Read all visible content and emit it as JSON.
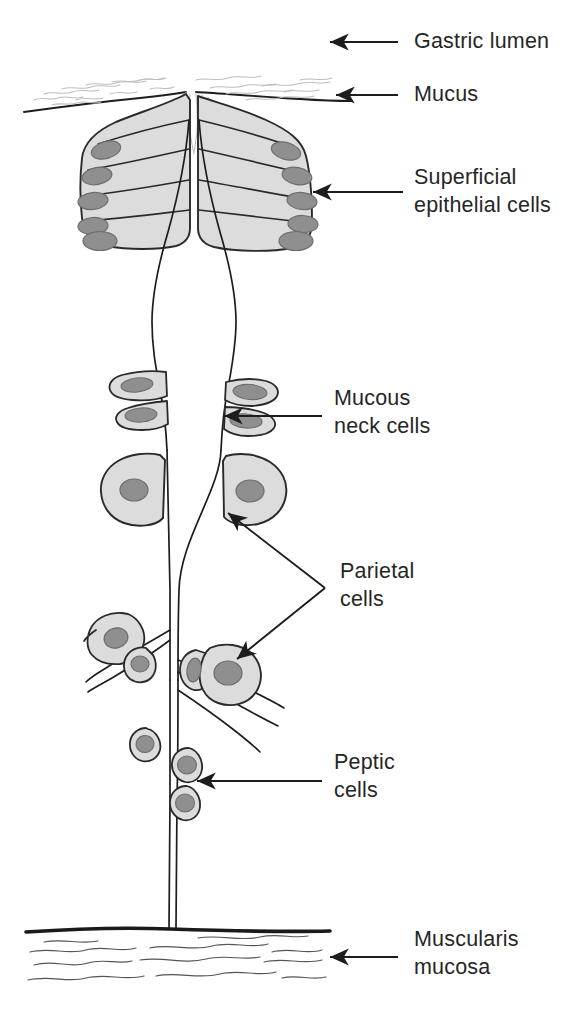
{
  "figure": {
    "background_color": "#ffffff",
    "line_color": "#1d1d1d",
    "cell_fill": "#dcdcdc",
    "nucleus_fill": "#8f8f8f",
    "label_color": "#262626"
  },
  "labels": [
    {
      "id": "gastric-lumen",
      "text": "Gastric lumen",
      "line2": "",
      "x": 414,
      "y": 48
    },
    {
      "id": "mucus",
      "text": "Mucus",
      "line2": "",
      "x": 414,
      "y": 101
    },
    {
      "id": "superficial",
      "text": "Superficial",
      "line2": "epithelial cells",
      "x": 414,
      "y": 184
    },
    {
      "id": "mucous-neck-cells",
      "text": "Mucous",
      "line2": "neck cells",
      "x": 334,
      "y": 405
    },
    {
      "id": "parietal-cells",
      "text": "Parietal",
      "line2": "cells",
      "x": 340,
      "y": 578
    },
    {
      "id": "peptic-cells",
      "text": "Peptic",
      "line2": "cells",
      "x": 334,
      "y": 769
    },
    {
      "id": "muscularis-mucosa",
      "text": "Muscularis",
      "line2": "mucosa",
      "x": 414,
      "y": 946
    }
  ],
  "arrows": [
    {
      "id": "arrow-gastric-lumen",
      "from": [
        398,
        42
      ],
      "to": [
        330,
        42
      ]
    },
    {
      "id": "arrow-mucus",
      "from": [
        398,
        95
      ],
      "to": [
        336,
        95
      ]
    },
    {
      "id": "arrow-superficial",
      "from": [
        403,
        192
      ],
      "to": [
        313,
        192
      ]
    },
    {
      "id": "arrow-mucous-neck",
      "from": [
        322,
        416
      ],
      "to": [
        224,
        416
      ]
    },
    {
      "id": "arrow-parietal-upper",
      "from": [
        325,
        588
      ],
      "to": [
        228,
        513
      ]
    },
    {
      "id": "arrow-parietal-lower",
      "from": [
        325,
        588
      ],
      "to": [
        237,
        659
      ]
    },
    {
      "id": "arrow-peptic",
      "from": [
        322,
        781
      ],
      "to": [
        197,
        781
      ]
    },
    {
      "id": "arrow-muscularis",
      "from": [
        398,
        957
      ],
      "to": [
        330,
        957
      ]
    }
  ],
  "structures": {
    "epithelial_cells_per_side": 5,
    "mucous_neck_cells": 4,
    "parietal_cells": 6,
    "peptic_cells": 5,
    "gastric_pit": "central flask-shaped duct",
    "muscularis_band": "thick dark horizontal line at y=930 with wavy fibers below"
  }
}
